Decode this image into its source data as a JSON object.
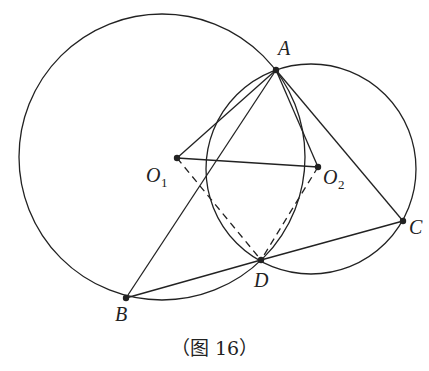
{
  "caption": "（图 16）",
  "colors": {
    "stroke": "#222222",
    "background": "#ffffff"
  },
  "circles": [
    {
      "name": "circle-O1",
      "cx": 162,
      "cy": 157,
      "r": 143
    },
    {
      "name": "circle-O2",
      "cx": 311,
      "cy": 169,
      "r": 105
    }
  ],
  "points": {
    "A": {
      "label": "A",
      "sub": "",
      "x": 276,
      "y": 70
    },
    "B": {
      "label": "B",
      "sub": "",
      "x": 126,
      "y": 298
    },
    "C": {
      "label": "C",
      "sub": "",
      "x": 403,
      "y": 221
    },
    "D": {
      "label": "D",
      "sub": "",
      "x": 261,
      "y": 260
    },
    "O1": {
      "label": "O",
      "sub": "1",
      "x": 177,
      "y": 158
    },
    "O2": {
      "label": "O",
      "sub": "2",
      "x": 318,
      "y": 167
    }
  },
  "segments": [
    {
      "from": "A",
      "to": "O1",
      "style": "solid"
    },
    {
      "from": "A",
      "to": "B",
      "style": "solid"
    },
    {
      "from": "A",
      "to": "O2",
      "style": "solid"
    },
    {
      "from": "A",
      "to": "C",
      "style": "solid"
    },
    {
      "from": "O1",
      "to": "O2",
      "style": "solid"
    },
    {
      "from": "B",
      "to": "D",
      "style": "solid"
    },
    {
      "from": "D",
      "to": "C",
      "style": "solid"
    },
    {
      "from": "O1",
      "to": "D",
      "style": "dashed"
    },
    {
      "from": "O2",
      "to": "D",
      "style": "dashed"
    }
  ],
  "labels": {
    "A": {
      "text": "A",
      "x": 278,
      "y": 55
    },
    "B": {
      "text": "B",
      "x": 115,
      "y": 321
    },
    "C": {
      "text": "C",
      "x": 409,
      "y": 234
    },
    "D": {
      "text": "D",
      "x": 254,
      "y": 287
    },
    "O1": {
      "text": "O",
      "sub": "1",
      "x": 146,
      "y": 182
    },
    "O2": {
      "text": "O",
      "sub": "2",
      "x": 323,
      "y": 184
    }
  }
}
